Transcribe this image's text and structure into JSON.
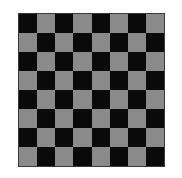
{
  "board": {
    "rows": 8,
    "cols": 8,
    "top_left": "dark",
    "colors": {
      "dark": "#0a0a0a",
      "light": "#8a8a8a",
      "border": "#3a3a3a",
      "background": "#ffffff"
    }
  }
}
